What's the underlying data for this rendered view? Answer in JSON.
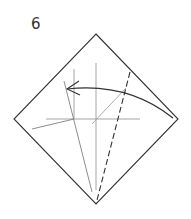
{
  "diagram": {
    "step_number": "6",
    "paper": {
      "shape": "square-diamond",
      "top": [
        96,
        34
      ],
      "right": [
        178,
        119
      ],
      "bottom": [
        96,
        204
      ],
      "left": [
        14,
        119
      ],
      "stroke": "#333333"
    },
    "creases": [
      {
        "name": "vertical-center-crease",
        "from": [
          96,
          63
        ],
        "to": [
          96,
          190
        ],
        "stroke": "#999999"
      },
      {
        "name": "horizontal-crease",
        "from": [
          46,
          119
        ],
        "to": [
          140,
          119
        ],
        "stroke": "#999999"
      },
      {
        "name": "left-vertical-crease",
        "from": [
          74,
          69
        ],
        "to": [
          74,
          119
        ],
        "stroke": "#999999"
      },
      {
        "name": "slanted-crease",
        "from": [
          64,
          81
        ],
        "to": [
          92,
          192
        ],
        "stroke": "#888888"
      },
      {
        "name": "lower-left-crease",
        "from": [
          32,
          129
        ],
        "to": [
          74,
          119
        ],
        "stroke": "#888888"
      },
      {
        "name": "diagonal-crease",
        "from": [
          92,
          124
        ],
        "to": [
          126,
          88
        ],
        "stroke": "#999999"
      }
    ],
    "fold_line": {
      "name": "valley-fold-line",
      "style": "dashed",
      "from": [
        130,
        72
      ],
      "to": [
        96,
        204
      ],
      "stroke": "#333333"
    },
    "arrow": {
      "name": "fold-direction-arrow",
      "from": [
        173,
        118
      ],
      "control": [
        128,
        82
      ],
      "to": [
        67,
        89
      ],
      "stroke": "#333333"
    }
  }
}
